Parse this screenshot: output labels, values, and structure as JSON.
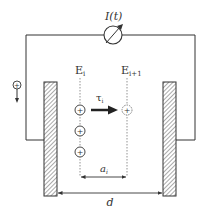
{
  "diagram": {
    "current_label": "I(t)",
    "current_label_parts": {
      "main": "I",
      "paren": "(t)"
    },
    "field_left_label": {
      "main": "E",
      "sub": "i"
    },
    "field_right_label": {
      "main": "E",
      "sub": "i+1"
    },
    "drift_time_label": {
      "main": "τ",
      "sub": "i"
    },
    "ion_spacing_label": {
      "main": "a",
      "sub": "i"
    },
    "electrode_gap_label": "d",
    "ion_symbol": "+",
    "source_symbol": "+",
    "ions": [
      {
        "name": "ion-1",
        "y": 110,
        "style": "solid"
      },
      {
        "name": "ion-2",
        "y": 131,
        "style": "solid"
      },
      {
        "name": "ion-3",
        "y": 152,
        "style": "solid"
      },
      {
        "name": "ion-displaced",
        "y": 110,
        "style": "dashed"
      }
    ],
    "colors": {
      "line": "#333333",
      "hatch": "#555555",
      "dashed": "#777777",
      "background": "#ffffff"
    },
    "icons": {
      "ammeter": "ammeter-icon",
      "charge_source": "positive-charge-icon",
      "drift_arrow": "arrow-right-icon"
    }
  }
}
